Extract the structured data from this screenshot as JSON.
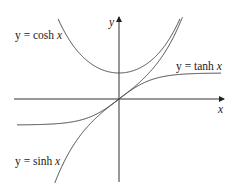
{
  "figure": {
    "axes": {
      "x_label": "x",
      "y_label": "y"
    },
    "curves": [
      {
        "name": "cosh",
        "label_prefix": "y = cosh ",
        "label_var": "x"
      },
      {
        "name": "tanh",
        "label_prefix": "y = tanh ",
        "label_var": "x"
      },
      {
        "name": "sinh",
        "label_prefix": "y = sinh ",
        "label_var": "x"
      }
    ],
    "colors": {
      "axis": "#333333",
      "curve": "#444444",
      "text": "#222222"
    }
  }
}
